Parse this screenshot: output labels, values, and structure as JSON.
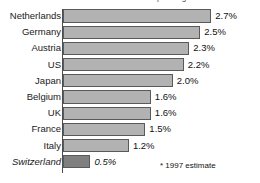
{
  "title": {
    "text": "Total Gross Domestic Product spending on research and development",
    "cropped": true
  },
  "footnote": "* 1997 estimate",
  "colors": {
    "bar_fill": "#b2b2b2",
    "bar_highlight_fill": "#7f7f7f",
    "bar_border": "#5a5a5a",
    "axis": "#4d4d4d",
    "text": "#111111",
    "background": "#ffffff"
  },
  "chart_data": {
    "type": "bar",
    "orientation": "horizontal",
    "title": "Total Gross Domestic Product spending on research and development",
    "xlabel": "",
    "ylabel": "",
    "xlim": [
      0,
      2.95
    ],
    "grid": false,
    "legend": false,
    "value_suffix": "%",
    "categories": [
      "Netherlands",
      "Germany",
      "Austria",
      "US",
      "Japan",
      "Belgium",
      "UK",
      "France",
      "Italy",
      "Switzerland"
    ],
    "values": [
      2.7,
      2.5,
      2.3,
      2.2,
      2.0,
      1.6,
      1.6,
      1.5,
      1.2,
      0.5
    ],
    "value_labels": [
      "2.7%",
      "2.5%",
      "2.3%",
      "2.2%",
      "2.0%",
      "1.6%",
      "1.6%",
      "1.5%",
      "1.2%",
      "0.5%"
    ],
    "highlight_index": 9,
    "annotations": [
      "* 1997 estimate"
    ]
  }
}
